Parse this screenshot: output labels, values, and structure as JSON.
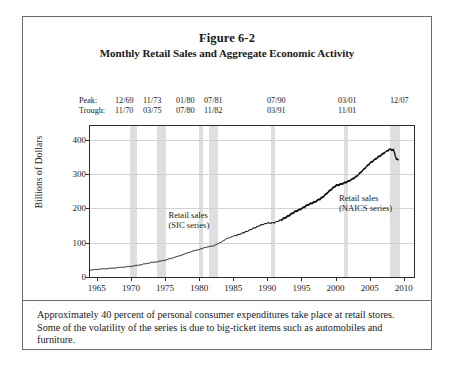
{
  "figure": {
    "number": "Figure 6-2",
    "title": "Monthly Retail Sales and Aggregate Economic Activity",
    "caption": "Approximately 40 percent of personal consumer expenditures take place at retail stores.  Some of the volatility of the series is due to big-ticket items such as automobiles and furniture."
  },
  "cycles": {
    "peak_label": "Peak:",
    "trough_label": "Trough:",
    "peaks": [
      "12/69",
      "11/73",
      "01/80",
      "07/81",
      "07/90",
      "03/01",
      "12/07"
    ],
    "troughs": [
      "11/70",
      "03/75",
      "07/80",
      "11/82",
      "03/91",
      "11/01",
      ""
    ]
  },
  "chart_data": {
    "type": "line",
    "title": "Monthly Retail Sales and Aggregate Economic Activity",
    "xlabel": "",
    "ylabel": "Billions of Dollars",
    "xlim": [
      1964,
      2011.5
    ],
    "ylim": [
      0,
      440
    ],
    "xticks": [
      1965,
      1970,
      1975,
      1980,
      1985,
      1990,
      1995,
      2000,
      2005,
      2010
    ],
    "yticks": [
      0,
      100,
      200,
      300,
      400
    ],
    "grid": true,
    "legend_position": "inline-annotations",
    "annotations": [
      {
        "text_line1": "Retail sales",
        "text_line2": "(SIC series)",
        "x": 1975.5,
        "y": 165
      },
      {
        "text_line1": "Retail sales",
        "text_line2": "(NAICS series)",
        "x": 2000.5,
        "y": 215
      }
    ],
    "recession_bands": [
      {
        "start": 1969.92,
        "end": 1970.83,
        "peak": "12/69",
        "trough": "11/70"
      },
      {
        "start": 1973.83,
        "end": 1975.17,
        "peak": "11/73",
        "trough": "03/75"
      },
      {
        "start": 1980.0,
        "end": 1980.5,
        "peak": "01/80",
        "trough": "07/80"
      },
      {
        "start": 1981.5,
        "end": 1982.83,
        "peak": "07/81",
        "trough": "11/82"
      },
      {
        "start": 1990.5,
        "end": 1991.17,
        "peak": "07/90",
        "trough": "03/91"
      },
      {
        "start": 2001.17,
        "end": 2001.83,
        "peak": "03/01",
        "trough": "11/01"
      },
      {
        "start": 2007.92,
        "end": 2009.42,
        "peak": "12/07",
        "trough": ""
      }
    ],
    "series": [
      {
        "name": "Retail sales (SIC series)",
        "x": [
          1964.0,
          1965.0,
          1966.0,
          1967.0,
          1968.0,
          1969.0,
          1970.0,
          1971.0,
          1972.0,
          1973.0,
          1974.0,
          1975.0,
          1976.0,
          1977.0,
          1978.0,
          1979.0,
          1980.0,
          1981.0,
          1982.0,
          1983.0,
          1984.0,
          1985.0,
          1986.0,
          1987.0,
          1988.0,
          1989.0,
          1990.0,
          1991.0,
          1992.0,
          1993.0,
          1994.0,
          1995.0,
          1996.0,
          1997.0,
          1998.0,
          1999.0,
          2000.0,
          2001.0
        ],
        "values": [
          20,
          22,
          24,
          25,
          27,
          29,
          31,
          34,
          38,
          42,
          45,
          49,
          55,
          61,
          68,
          75,
          80,
          87,
          90,
          99,
          111,
          119,
          125,
          133,
          142,
          151,
          157,
          158,
          166,
          177,
          190,
          199,
          211,
          219,
          231,
          249,
          266,
          272
        ]
      },
      {
        "name": "Retail sales (NAICS series)",
        "x": [
          1992.0,
          1993.0,
          1994.0,
          1995.0,
          1996.0,
          1997.0,
          1998.0,
          1999.0,
          2000.0,
          2001.0,
          2002.0,
          2003.0,
          2004.0,
          2005.0,
          2006.0,
          2007.0,
          2007.9,
          2008.5,
          2008.9,
          2009.2
        ],
        "values": [
          166,
          177,
          190,
          199,
          211,
          219,
          231,
          249,
          266,
          272,
          280,
          292,
          311,
          331,
          346,
          360,
          372,
          370,
          345,
          340
        ]
      }
    ]
  },
  "axis_text": {
    "y_title": "Billions of Dollars"
  }
}
